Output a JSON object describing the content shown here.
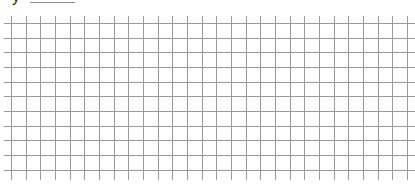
{
  "header": {
    "label_fragment": "y",
    "blank_line": true
  },
  "grid": {
    "line_color": "#999999",
    "background": "#ffffff",
    "vertical_lines_x_start": 11,
    "vertical_lines_count": 28,
    "horizontal_lines_y_start": 23,
    "horizontal_lines_count": 11,
    "spacing": 14.66,
    "h_extent": [
      4,
      415
    ],
    "v_extent": [
      16,
      180
    ]
  }
}
